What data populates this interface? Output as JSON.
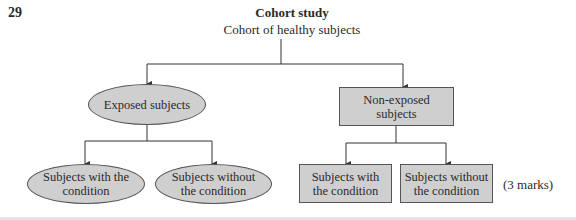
{
  "question": {
    "number": "29",
    "marks": "(3 marks)"
  },
  "diagram": {
    "title": "Cohort study",
    "root": "Cohort of healthy subjects",
    "exposed": {
      "label": "Exposed subjects",
      "shape": "ellipse",
      "children": [
        "Subjects with the condition",
        "Subjects without the condition"
      ]
    },
    "non_exposed": {
      "label": "Non-exposed subjects",
      "shape": "rectangle",
      "children": [
        "Subjects with the condition",
        "Subjects without the condition"
      ]
    },
    "colors": {
      "node_fill": "#cfcfcf",
      "stroke": "#555555"
    }
  }
}
